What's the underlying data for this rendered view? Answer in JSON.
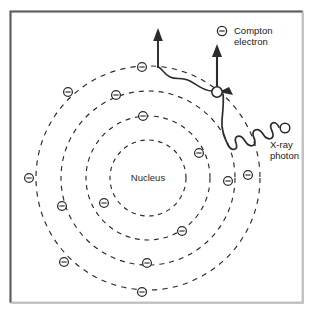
{
  "figure": {
    "background_color": "#ffffff",
    "ink_color": "#2b2b2b",
    "frame": {
      "name": "image-border",
      "x": 10,
      "y": 11,
      "width": 293,
      "height": 292,
      "dark_edge_color": "#5a5a5a",
      "light_edge_color": "#b9b9b9"
    }
  },
  "atom": {
    "center": {
      "x": 148,
      "y": 178
    },
    "nucleus_label": "Nucleus",
    "shells": [
      {
        "name": "shell-1",
        "radius": 38
      },
      {
        "name": "shell-2",
        "radius": 62
      },
      {
        "name": "shell-3",
        "radius": 87
      },
      {
        "name": "shell-4",
        "radius": 112
      }
    ],
    "electron_symbol": "circle-with-minus",
    "electrons": [
      {
        "shell": 2,
        "x": 143,
        "y": 116
      },
      {
        "shell": 2,
        "x": 199,
        "y": 153
      },
      {
        "shell": 2,
        "x": 182,
        "y": 231
      },
      {
        "shell": 2,
        "x": 104,
        "y": 203
      },
      {
        "shell": 3,
        "x": 116,
        "y": 95
      },
      {
        "shell": 3,
        "x": 228,
        "y": 181
      },
      {
        "shell": 3,
        "x": 147,
        "y": 263
      },
      {
        "shell": 3,
        "x": 62,
        "y": 206
      },
      {
        "shell": 4,
        "x": 142,
        "y": 67
      },
      {
        "shell": 4,
        "x": 68,
        "y": 92
      },
      {
        "shell": 4,
        "x": 29,
        "y": 178
      },
      {
        "shell": 4,
        "x": 64,
        "y": 262
      },
      {
        "shell": 4,
        "x": 142,
        "y": 292
      },
      {
        "shell": 4,
        "x": 248,
        "y": 175
      }
    ]
  },
  "interaction": {
    "collision_point": {
      "x": 217,
      "y": 92,
      "radius": 5.2
    },
    "incident_photon": {
      "label_line_1": "X-ray",
      "label_line_2": "photon",
      "label_x": 270,
      "label_y": 148,
      "source_marker": {
        "x": 285,
        "y": 128,
        "radius": 5.0
      },
      "wave_description": "sine wave travelling up-left toward the collision point",
      "arrowhead_at": {
        "x": 222,
        "y": 93
      }
    },
    "compton_electron": {
      "label_line_1": "Compton",
      "label_line_2": "electron",
      "label_x": 234,
      "label_y": 34,
      "legend_marker": {
        "x": 222,
        "y": 31
      },
      "arrow": {
        "from_x": 217,
        "from_y": 88,
        "to_x": 217,
        "to_y": 44
      }
    },
    "scattered_photon": {
      "wave_description": "low-amplitude wave leaving the collision point toward upper-left",
      "arrow": {
        "from_x": 158,
        "from_y": 68,
        "to_x": 158,
        "to_y": 28
      }
    }
  }
}
